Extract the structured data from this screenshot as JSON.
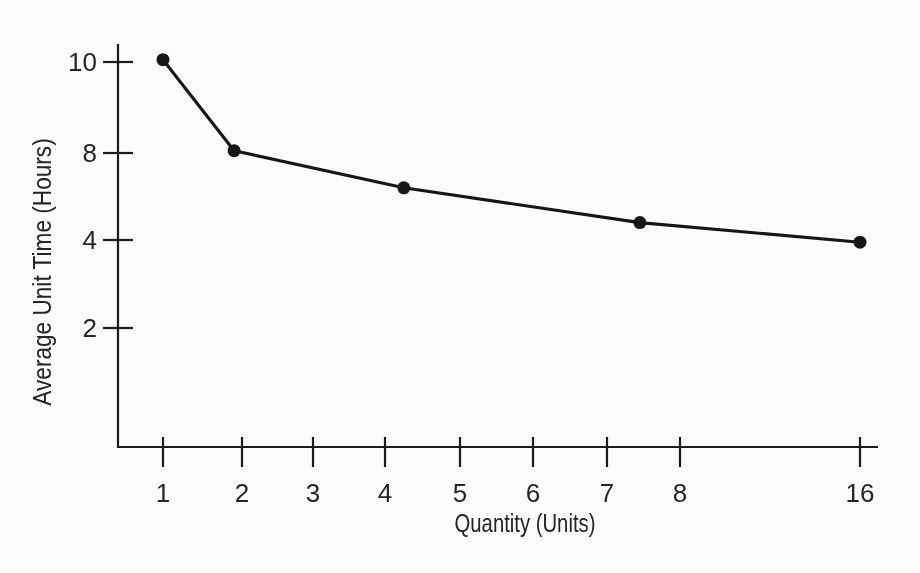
{
  "page": {
    "background": "#fcfcfb",
    "ink_color": "#1b1b1b",
    "text_color": "#262626"
  },
  "chart_data": {
    "type": "line",
    "title": "",
    "xlabel": "Quantity (Units)",
    "ylabel": "Average Unit Time (Hours)",
    "grid": false,
    "legend": false,
    "x_axis": {
      "ticks": [
        {
          "label": "1",
          "value": 1
        },
        {
          "label": "2",
          "value": 2
        },
        {
          "label": "3",
          "value": 3
        },
        {
          "label": "4",
          "value": 4
        },
        {
          "label": "5",
          "value": 5
        },
        {
          "label": "6",
          "value": 6
        },
        {
          "label": "7",
          "value": 7
        },
        {
          "label": "8",
          "value": 8
        },
        {
          "label": "16",
          "value": 16
        }
      ],
      "scale_note": "linear 1-8, compressed segment 8-16"
    },
    "y_axis": {
      "ticks": [
        {
          "label": "10",
          "value": 10
        },
        {
          "label": "8",
          "value": 8
        },
        {
          "label": "4",
          "value": 4
        },
        {
          "label": "2",
          "value": 2
        }
      ]
    },
    "series": [
      {
        "name": "average-unit-time-curve",
        "marker": "filled-circle",
        "line_color": "#161616",
        "points": [
          {
            "x": 1,
            "y": 10.05
          },
          {
            "x": 1.9,
            "y": 8.05
          },
          {
            "x": 4.25,
            "y": 6.4
          },
          {
            "x": 7.45,
            "y": 4.8
          },
          {
            "x": 16,
            "y": 3.95
          }
        ]
      }
    ]
  }
}
